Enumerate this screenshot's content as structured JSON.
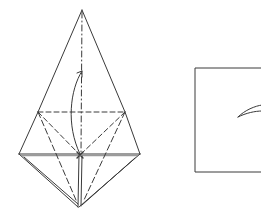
{
  "diagram": {
    "type": "origami-fold-step",
    "stroke_color": "#3a3a3a",
    "background": "#ffffff",
    "left_figure": {
      "description": "kite-shaped folded paper with valley fold lines and fold-up arrow",
      "apex": [
        82,
        10
      ],
      "left_mid": [
        38,
        112
      ],
      "right_mid": [
        125,
        112
      ],
      "left_base": [
        19,
        154
      ],
      "right_base": [
        140,
        154
      ],
      "center_point": [
        80,
        155
      ],
      "bottom_tip": [
        78,
        207
      ],
      "arrow": "curved arrow from center point up toward apex"
    },
    "right_figure": {
      "description": "partial square with inner curved arrow",
      "left": 195,
      "top": 68,
      "bottom": 172,
      "arrow_tip": [
        238,
        117
      ]
    }
  }
}
